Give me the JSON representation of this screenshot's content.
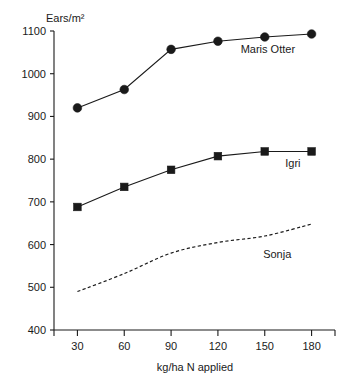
{
  "chart_data": {
    "type": "line",
    "title": "",
    "ylabel": "Ears/m²",
    "xlabel": "kg/ha N applied",
    "x": [
      30,
      60,
      90,
      120,
      150,
      180
    ],
    "categories": [
      "30",
      "60",
      "90",
      "120",
      "150",
      "180"
    ],
    "xlim": [
      15,
      195
    ],
    "ylim": [
      400,
      1100
    ],
    "ytick_labels": [
      "400",
      "500",
      "600",
      "700",
      "800",
      "900",
      "1000",
      "1100"
    ],
    "yticks": [
      400,
      500,
      600,
      700,
      800,
      900,
      1000,
      1100
    ],
    "grid": false,
    "legend_position": "inline-right-of-curve",
    "series": [
      {
        "name": "Maris Otter",
        "values": [
          920,
          963,
          1057,
          1076,
          1086,
          1093
        ],
        "marker": "filled-circle",
        "linestyle": "solid",
        "color": "#1a1a1a",
        "label_x": 152,
        "label_y": 1048
      },
      {
        "name": "Igri",
        "values": [
          688,
          735,
          775,
          807,
          818,
          818
        ],
        "marker": "filled-square",
        "linestyle": "solid",
        "color": "#1a1a1a",
        "label_x": 168,
        "label_y": 782
      },
      {
        "name": "Sonja",
        "values": [
          490,
          532,
          580,
          605,
          620,
          648
        ],
        "marker": "none",
        "linestyle": "dashed",
        "color": "#1a1a1a",
        "label_x": 158,
        "label_y": 568
      }
    ]
  },
  "axes": {
    "y_axis_title": "Ears/m²",
    "x_axis_title": "kg/ha N applied"
  },
  "labels": {
    "y0": "400",
    "y1": "500",
    "y2": "600",
    "y3": "700",
    "y4": "800",
    "y5": "900",
    "y6": "1000",
    "y7": "1100",
    "x0": "30",
    "x1": "60",
    "x2": "90",
    "x3": "120",
    "x4": "150",
    "x5": "180",
    "s0": "Maris Otter",
    "s1": "Igri",
    "s2": "Sonja"
  }
}
